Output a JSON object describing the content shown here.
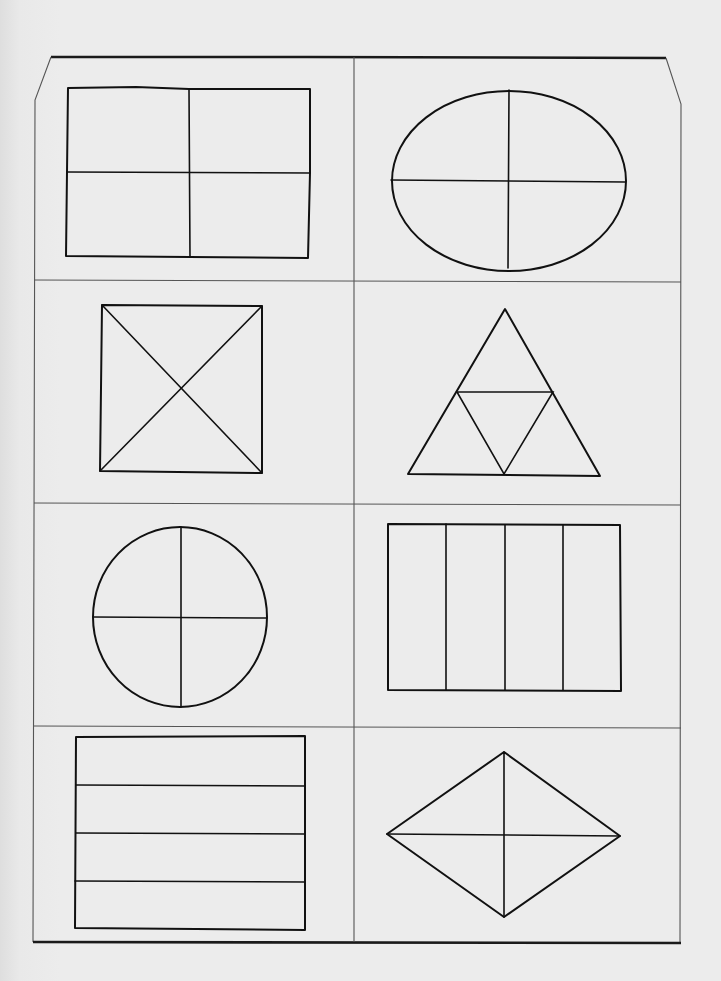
{
  "worksheet": {
    "title": "",
    "layout": {
      "rows": 4,
      "columns": 2
    },
    "colors": {
      "paper": "#ececec",
      "ink": "#111111",
      "grid": "#555555"
    },
    "cells": [
      {
        "row": 1,
        "col": 1,
        "shape": "rectangle",
        "division": "2x2 grid",
        "equal_parts": 4
      },
      {
        "row": 1,
        "col": 2,
        "shape": "ellipse (wide)",
        "division": "vertical + horizontal axes",
        "equal_parts": 4
      },
      {
        "row": 2,
        "col": 1,
        "shape": "square",
        "division": "two diagonals",
        "equal_parts": 4
      },
      {
        "row": 2,
        "col": 2,
        "shape": "triangle",
        "division": "midpoint triangle",
        "equal_parts": 4
      },
      {
        "row": 3,
        "col": 1,
        "shape": "ellipse (tall)",
        "division": "vertical + horizontal axes",
        "equal_parts": 4
      },
      {
        "row": 3,
        "col": 2,
        "shape": "rectangle",
        "division": "vertical strips",
        "equal_parts": 4
      },
      {
        "row": 4,
        "col": 1,
        "shape": "rectangle",
        "division": "horizontal strips",
        "equal_parts": 4
      },
      {
        "row": 4,
        "col": 2,
        "shape": "rhombus",
        "division": "both diagonals",
        "equal_parts": 4
      }
    ]
  }
}
